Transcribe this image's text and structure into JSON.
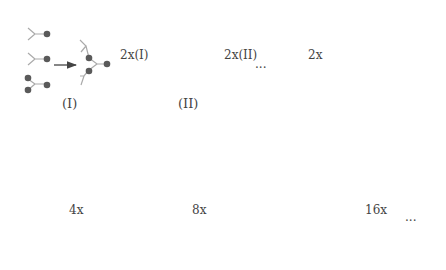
{
  "colors": {
    "bond": "#aaaaaa",
    "gray_node": "#5a5a5a",
    "black_node": "#151515",
    "arrow": "#444444",
    "sector_outline": "#999999",
    "text": "#444444"
  },
  "top_row": {
    "step1_label": "(I)",
    "arrow1_label": "2x(I)",
    "step2_label": "(II)",
    "arrow2_label": "2x(II)",
    "ellipsis": "...",
    "arrow3_label": "2x"
  },
  "bottom_row": {
    "arrow1_label": "4x",
    "arrow2_label": "8x",
    "arrow3_label": "16x",
    "ellipsis": "..."
  }
}
